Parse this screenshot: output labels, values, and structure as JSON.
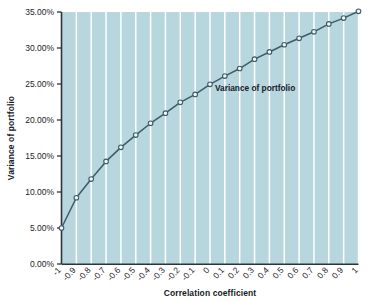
{
  "chart_data": {
    "type": "line",
    "title": "",
    "subtitle": "",
    "xlabel": "Correlation coefficient",
    "ylabel": "Variance of portfolio",
    "xlim": [
      -1,
      1
    ],
    "ylim": [
      0,
      0.35
    ],
    "grid": "vertical-only",
    "legend_position": "inline-annotation",
    "annotations": [
      {
        "text": "Variance of portfolio",
        "x": 0.18,
        "y": 0.245
      }
    ],
    "series": [
      {
        "name": "Variance of portfolio",
        "marker": "circle",
        "color": "#3d5b68",
        "marker_face": "#f2f8f9",
        "x": [
          -1,
          -0.9,
          -0.8,
          -0.7,
          -0.6,
          -0.5,
          -0.4,
          -0.3,
          -0.2,
          -0.1,
          0,
          0.1,
          0.2,
          0.3,
          0.4,
          0.5,
          0.6,
          0.7,
          0.8,
          0.9,
          1
        ],
        "values": [
          0.05,
          0.092,
          0.118,
          0.1425,
          0.162,
          0.179,
          0.1955,
          0.2095,
          0.2245,
          0.2355,
          0.2495,
          0.261,
          0.2715,
          0.2845,
          0.2945,
          0.3045,
          0.3135,
          0.3225,
          0.3335,
          0.3415,
          0.351
        ]
      }
    ],
    "x_tick_labels": [
      "-1",
      "-0.9",
      "-0.8",
      "-0.7",
      "-0.6",
      "-0.5",
      "-0.4",
      "-0.3",
      "-0.2",
      "-0.1",
      "0",
      "0.1",
      "0.2",
      "0.3",
      "0.4",
      "0.5",
      "0.6",
      "0.7",
      "0.8",
      "0.9",
      "1"
    ],
    "x_tick_values": [
      -1,
      -0.9,
      -0.8,
      -0.7,
      -0.6,
      -0.5,
      -0.4,
      -0.3,
      -0.2,
      -0.1,
      0,
      0.1,
      0.2,
      0.3,
      0.4,
      0.5,
      0.6,
      0.7,
      0.8,
      0.9,
      1
    ],
    "y_tick_labels": [
      "0.00%",
      "5.00%",
      "10.00%",
      "15.00%",
      "20.00%",
      "25.00%",
      "30.00%",
      "35.00%"
    ],
    "y_tick_values": [
      0,
      0.05,
      0.1,
      0.15,
      0.2,
      0.25,
      0.3,
      0.35
    ],
    "colors": {
      "plot_background": "#b7d6dd",
      "gridline": "#ffffff",
      "axis": "#2c3339",
      "line": "#3d5b68",
      "marker_fill": "#f4fafb",
      "figure_background": "#ffffff",
      "text": "#1d2328"
    }
  }
}
